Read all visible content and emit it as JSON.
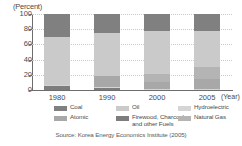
{
  "chart_data": {
    "type": "bar",
    "stacked": true,
    "title": "",
    "subtitle": "",
    "xlabel": "(Year)",
    "ylabel": "(Percent)",
    "ylim": [
      0,
      100
    ],
    "yticks": [
      0,
      20,
      40,
      60,
      80,
      100
    ],
    "grid": true,
    "legend_position": "bottom",
    "categories": [
      "1980",
      "1990",
      "2000",
      "2005"
    ],
    "series": [
      {
        "name": "Firewood, Charcoal and other Fuels",
        "color": "#7d7d7d",
        "values": [
          6,
          3,
          0,
          0
        ]
      },
      {
        "name": "Hydroelectric",
        "color": "#d5d5d5",
        "values": [
          1,
          1,
          1,
          1
        ]
      },
      {
        "name": "Atomic",
        "color": "#a8a8a8",
        "values": [
          0,
          14,
          9,
          14
        ]
      },
      {
        "name": "Natural Gas",
        "color": "#b4b4b4",
        "values": [
          0,
          0,
          11,
          15
        ]
      },
      {
        "name": "Oil",
        "color": "#cacaca",
        "values": [
          63,
          57,
          57,
          47
        ]
      },
      {
        "name": "Coal",
        "color": "#808080",
        "values": [
          30,
          25,
          22,
          23
        ]
      }
    ],
    "source": "Source: Korea Energy Economics Institute (2005)"
  },
  "axes": {
    "y_unit_label": "(Percent)",
    "x_unit_label": "(Year)",
    "ytick_labels": [
      "0",
      "20",
      "40",
      "60",
      "80",
      "100"
    ],
    "xtick_labels": [
      "1980",
      "1990",
      "2000",
      "2005"
    ]
  },
  "legend": {
    "items": [
      {
        "label": "Coal",
        "color": "#808080"
      },
      {
        "label": "Oil",
        "color": "#cacaca"
      },
      {
        "label": "Hydroelectric",
        "color": "#d5d5d5"
      },
      {
        "label": "Atomic",
        "color": "#a8a8a8"
      },
      {
        "label": "Firewood, Charcoal and other Fuels",
        "color": "#7d7d7d"
      },
      {
        "label": "Natural Gas",
        "color": "#b4b4b4"
      }
    ]
  },
  "source": {
    "text": "Source: Korea Energy Economics Institute (2005)"
  }
}
